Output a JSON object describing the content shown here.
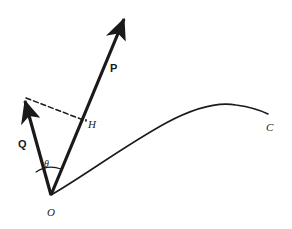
{
  "figure": {
    "kind": "vector-projection-diagram",
    "background_color": "#ffffff",
    "ink_color": "#1a1a1a",
    "width": 292,
    "height": 229
  },
  "labels": {
    "vector_p": "P",
    "vector_q": "Q",
    "point_h": "H",
    "point_o": "O",
    "curve_c": "C",
    "angle_theta": "θ"
  },
  "geometry": {
    "origin": {
      "x": 51,
      "y": 195
    },
    "vector_p": {
      "from": {
        "x": 51,
        "y": 195
      },
      "to": {
        "x": 127,
        "y": 12
      },
      "stroke_width": 3.2,
      "arrow": true
    },
    "vector_q": {
      "from": {
        "x": 51,
        "y": 195
      },
      "to": {
        "x": 23,
        "y": 95
      },
      "stroke_width": 3.2,
      "arrow": true
    },
    "projection_foot": {
      "x": 86,
      "y": 120
    },
    "dashed_line": {
      "from": {
        "x": 25,
        "y": 97
      },
      "to": {
        "x": 86,
        "y": 121
      },
      "stroke_width": 1.5,
      "dash": "5,3"
    },
    "angle_arc": {
      "center": {
        "x": 51,
        "y": 195
      },
      "radius": 27,
      "stroke_width": 1.2
    },
    "curve_c": {
      "start": {
        "x": 51,
        "y": 195
      },
      "peak": {
        "x": 233,
        "y": 104
      },
      "end": {
        "x": 268,
        "y": 114
      },
      "stroke_width": 1.6
    }
  },
  "label_positions": {
    "vector_p": {
      "x": 110,
      "y": 72
    },
    "vector_q": {
      "x": 18,
      "y": 148
    },
    "point_h": {
      "x": 88,
      "y": 128
    },
    "point_o": {
      "x": 47,
      "y": 216
    },
    "curve_c": {
      "x": 268,
      "y": 131
    },
    "angle_theta": {
      "x": 44,
      "y": 167
    }
  }
}
